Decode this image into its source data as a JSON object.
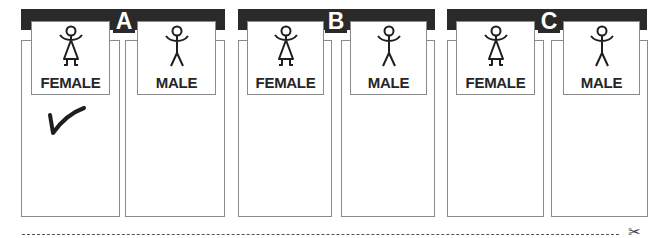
{
  "groups": [
    {
      "letter": "A",
      "options": [
        {
          "label": "FEMALE",
          "figure": "female-figure-icon",
          "checked": true
        },
        {
          "label": "MALE",
          "figure": "male-figure-icon",
          "checked": false
        }
      ]
    },
    {
      "letter": "B",
      "options": [
        {
          "label": "FEMALE",
          "figure": "female-figure-icon",
          "checked": false
        },
        {
          "label": "MALE",
          "figure": "male-figure-icon",
          "checked": false
        }
      ]
    },
    {
      "letter": "C",
      "options": [
        {
          "label": "FEMALE",
          "figure": "female-figure-icon",
          "checked": false
        },
        {
          "label": "MALE",
          "figure": "male-figure-icon",
          "checked": false
        }
      ]
    }
  ],
  "cut_line": {
    "icon": "scissors-icon",
    "glyph": "✂"
  },
  "colors": {
    "bar": "#2a2a2a",
    "border": "#8a8a8a",
    "text": "#262626"
  }
}
